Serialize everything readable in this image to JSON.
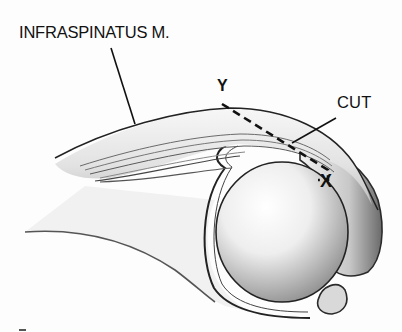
{
  "figure": {
    "labels": {
      "muscle": "INFRASPINATUS M.",
      "cut": "CUT",
      "point_y": "Y",
      "point_x": "X"
    },
    "colors": {
      "background": "#fdfdfd",
      "ink": "#111111",
      "shade_dark": "#5a5a5a",
      "shade_mid": "#9a9a9a",
      "shade_light": "#d8d8d8"
    }
  }
}
